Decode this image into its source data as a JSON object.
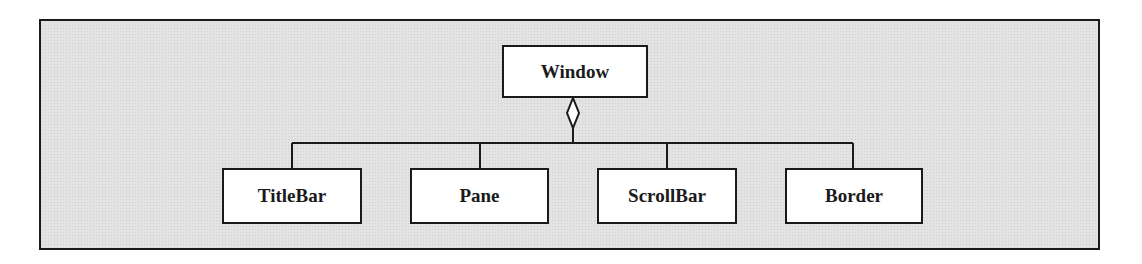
{
  "diagram": {
    "type": "uml-class-aggregation",
    "parent": {
      "label": "Window"
    },
    "children": [
      {
        "label": "TitleBar"
      },
      {
        "label": "Pane"
      },
      {
        "label": "ScrollBar"
      },
      {
        "label": "Border"
      }
    ],
    "relationship": "aggregation",
    "colors": {
      "background": "#e3e3e3",
      "box_fill": "#ffffff",
      "stroke": "#1a1a1a"
    }
  }
}
